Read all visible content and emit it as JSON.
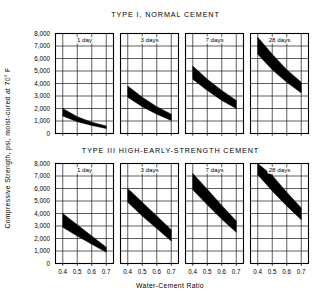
{
  "figure": {
    "y_axis_label": "Compressive Strength, psi, moist-cured at 70° F",
    "x_axis_label": "Water-Cement Ratio",
    "y_ticks": [
      "8,000",
      "7,000",
      "6,000",
      "5,000",
      "4,000",
      "3,000",
      "2,000",
      "1,000",
      "0"
    ],
    "x_ticks": [
      "0.4",
      "0.5",
      "0.6",
      "0.7"
    ],
    "ink_color": "#000000",
    "grid_color": "#1a1a1a",
    "background_color": "#ffffff"
  },
  "chart_data": [
    {
      "type": "area",
      "title": "TYPE I, NORMAL CEMENT",
      "xlabel": "Water-Cement Ratio",
      "ylabel": "Compressive Strength, psi, moist-cured at 70° F",
      "xlim": [
        0.35,
        0.75
      ],
      "ylim": [
        0,
        8000
      ],
      "grid": true,
      "legend": "none",
      "panels": [
        {
          "label": "1 day",
          "x": [
            0.4,
            0.5,
            0.6,
            0.7
          ],
          "upper": [
            2000,
            1350,
            900,
            600
          ],
          "lower": [
            1400,
            950,
            650,
            400
          ]
        },
        {
          "label": "3 days",
          "x": [
            0.4,
            0.5,
            0.6,
            0.7
          ],
          "upper": [
            3800,
            2900,
            2150,
            1550
          ],
          "lower": [
            2900,
            2150,
            1550,
            1050
          ]
        },
        {
          "label": "7 days",
          "x": [
            0.4,
            0.5,
            0.6,
            0.7
          ],
          "upper": [
            5400,
            4350,
            3450,
            2650
          ],
          "lower": [
            4350,
            3450,
            2650,
            2000
          ]
        },
        {
          "label": "28 days",
          "x": [
            0.4,
            0.5,
            0.6,
            0.7
          ],
          "upper": [
            7700,
            6350,
            5100,
            4100
          ],
          "lower": [
            6350,
            5100,
            4100,
            3250
          ]
        }
      ]
    },
    {
      "type": "area",
      "title": "TYPE III HIGH-EARLY-STRENGTH CEMENT",
      "xlabel": "Water-Cement Ratio",
      "ylabel": "Compressive Strength, psi, moist-cured at 70° F",
      "xlim": [
        0.35,
        0.75
      ],
      "ylim": [
        0,
        8000
      ],
      "grid": true,
      "legend": "none",
      "panels": [
        {
          "label": "1 day",
          "x": [
            0.4,
            0.5,
            0.6,
            0.7
          ],
          "upper": [
            4000,
            3100,
            2200,
            1300
          ],
          "lower": [
            2900,
            2200,
            1550,
            900
          ]
        },
        {
          "label": "3 days",
          "x": [
            0.4,
            0.5,
            0.6,
            0.7
          ],
          "upper": [
            6000,
            4900,
            3800,
            2700
          ],
          "lower": [
            4900,
            3800,
            2800,
            1800
          ]
        },
        {
          "label": "7 days",
          "x": [
            0.4,
            0.5,
            0.6,
            0.7
          ],
          "upper": [
            7200,
            5950,
            4650,
            3400
          ],
          "lower": [
            5900,
            4700,
            3550,
            2500
          ]
        },
        {
          "label": "28 days",
          "x": [
            0.4,
            0.5,
            0.6,
            0.7
          ],
          "upper": [
            8300,
            7050,
            5700,
            4450
          ],
          "lower": [
            7100,
            5800,
            4600,
            3500
          ]
        }
      ]
    }
  ]
}
